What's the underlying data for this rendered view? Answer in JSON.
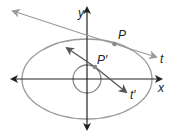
{
  "diagram": {
    "labels": {
      "y_axis": "y",
      "x_axis": "x",
      "point_p": "P",
      "point_p_prime": "P′",
      "tangent_t": "t",
      "tangent_t_prime": "t′"
    },
    "colors": {
      "curve": "#9a9a9a",
      "axis": "#222222",
      "point": "#8a8a8a"
    }
  }
}
